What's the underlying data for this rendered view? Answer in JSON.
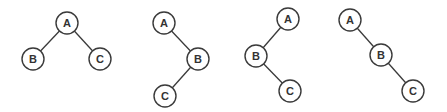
{
  "diagram": {
    "node_radius": 11,
    "colors": {
      "stroke": "#3a3a3a",
      "text": "#333333",
      "fill": "#ffffff",
      "background": "#ffffff"
    },
    "trees": [
      {
        "id": "tree-1",
        "nodes": [
          {
            "label": "A",
            "x": 67,
            "y": 23
          },
          {
            "label": "B",
            "x": 33,
            "y": 59
          },
          {
            "label": "C",
            "x": 100,
            "y": 59
          }
        ],
        "edges": [
          [
            "A",
            "B"
          ],
          [
            "A",
            "C"
          ]
        ]
      },
      {
        "id": "tree-2",
        "nodes": [
          {
            "label": "A",
            "x": 164,
            "y": 23
          },
          {
            "label": "B",
            "x": 198,
            "y": 59
          },
          {
            "label": "C",
            "x": 165,
            "y": 96
          }
        ],
        "edges": [
          [
            "A",
            "B"
          ],
          [
            "B",
            "C"
          ]
        ]
      },
      {
        "id": "tree-3",
        "nodes": [
          {
            "label": "A",
            "x": 288,
            "y": 19
          },
          {
            "label": "B",
            "x": 256,
            "y": 56
          },
          {
            "label": "C",
            "x": 290,
            "y": 91
          }
        ],
        "edges": [
          [
            "A",
            "B"
          ],
          [
            "B",
            "C"
          ]
        ]
      },
      {
        "id": "tree-4",
        "nodes": [
          {
            "label": "A",
            "x": 350,
            "y": 20
          },
          {
            "label": "B",
            "x": 381,
            "y": 55
          },
          {
            "label": "C",
            "x": 413,
            "y": 91
          }
        ],
        "edges": [
          [
            "A",
            "B"
          ],
          [
            "B",
            "C"
          ]
        ]
      }
    ]
  }
}
